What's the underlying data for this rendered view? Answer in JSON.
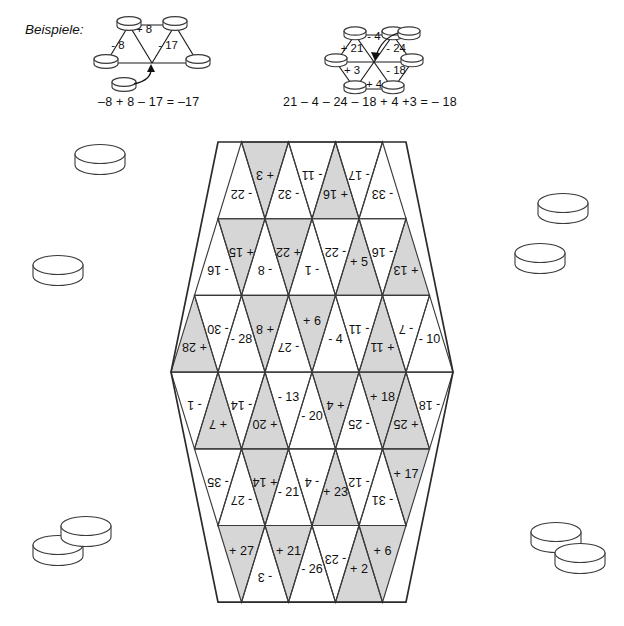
{
  "worksheet": {
    "heading": "Beispiele:",
    "examples": [
      {
        "name": "example-trapezoid",
        "edge_labels": [
          "- 8",
          "+ 8",
          "- 17"
        ],
        "equation": "–8 + 8 – 17 = –17",
        "chip_count": 4,
        "loose_chip": 1
      },
      {
        "name": "example-hexagon",
        "edge_labels": [
          "- 4",
          "+ 21",
          "- 24",
          "+ 3",
          "- 18",
          "+ 4"
        ],
        "equation": "21 – 4 – 24 – 18 + 4 +3 = – 18",
        "chip_count": 6,
        "loose_chip": 1
      }
    ]
  },
  "board": {
    "name": "hexagon-triangle-board",
    "rows": 6,
    "row_counts": [
      7,
      9,
      11,
      11,
      9,
      7
    ],
    "shaded_color": "#d6d6d6",
    "unshaded_color": "#ffffff",
    "stroke_color": "#3a3a3a",
    "cells": [
      [
        {
          "v": "- 22",
          "shaded": false,
          "dir": "up",
          "rot": 180
        },
        {
          "v": "+ 3",
          "shaded": true,
          "dir": "down",
          "rot": 180
        },
        {
          "v": "- 32",
          "shaded": false,
          "dir": "up",
          "rot": 180
        },
        {
          "v": "- 11",
          "shaded": false,
          "dir": "down",
          "rot": 180
        },
        {
          "v": "+ 16",
          "shaded": true,
          "dir": "up",
          "rot": 180
        },
        {
          "v": "- 17",
          "shaded": false,
          "dir": "down",
          "rot": 180
        },
        {
          "v": "- 33",
          "shaded": false,
          "dir": "up",
          "rot": 180
        }
      ],
      [
        {
          "v": "- 16",
          "shaded": false,
          "dir": "up",
          "rot": 180
        },
        {
          "v": "+ 15",
          "shaded": true,
          "dir": "down",
          "rot": 180
        },
        {
          "v": "- 8",
          "shaded": false,
          "dir": "up",
          "rot": 180
        },
        {
          "v": "+ 22",
          "shaded": true,
          "dir": "down",
          "rot": 180
        },
        {
          "v": "- 1",
          "shaded": false,
          "dir": "up",
          "rot": 180
        },
        {
          "v": "- 22",
          "shaded": false,
          "dir": "down",
          "rot": 180
        },
        {
          "v": "+ 5",
          "shaded": true,
          "dir": "up",
          "rot": 0
        },
        {
          "v": "- 16",
          "shaded": false,
          "dir": "down",
          "rot": 180
        },
        {
          "v": "+ 13",
          "shaded": true,
          "dir": "up",
          "rot": 180
        }
      ],
      [
        {
          "v": "+ 28",
          "shaded": true,
          "dir": "up",
          "rot": 180
        },
        {
          "v": "- 30",
          "shaded": false,
          "dir": "down",
          "rot": 180
        },
        {
          "v": "- 28",
          "shaded": false,
          "dir": "up",
          "rot": 0
        },
        {
          "v": "+ 8",
          "shaded": true,
          "dir": "down",
          "rot": 180
        },
        {
          "v": "- 27",
          "shaded": false,
          "dir": "up",
          "rot": 180
        },
        {
          "v": "+ 6",
          "shaded": true,
          "dir": "down",
          "rot": 0
        },
        {
          "v": "- 4",
          "shaded": false,
          "dir": "up",
          "rot": 0
        },
        {
          "v": "- 11",
          "shaded": false,
          "dir": "down",
          "rot": 180
        },
        {
          "v": "+ 11",
          "shaded": true,
          "dir": "up",
          "rot": 180
        },
        {
          "v": "- 7",
          "shaded": false,
          "dir": "down",
          "rot": 180
        },
        {
          "v": "- 10",
          "shaded": false,
          "dir": "up",
          "rot": 0
        }
      ],
      [
        {
          "v": "- 1",
          "shaded": false,
          "dir": "down",
          "rot": 180
        },
        {
          "v": "+ 7",
          "shaded": true,
          "dir": "up",
          "rot": 180
        },
        {
          "v": "- 14",
          "shaded": false,
          "dir": "down",
          "rot": 180
        },
        {
          "v": "+ 20",
          "shaded": true,
          "dir": "up",
          "rot": 180
        },
        {
          "v": "- 13",
          "shaded": false,
          "dir": "down",
          "rot": 0
        },
        {
          "v": "- 20",
          "shaded": false,
          "dir": "up",
          "rot": 0
        },
        {
          "v": "+ 4",
          "shaded": true,
          "dir": "down",
          "rot": 180
        },
        {
          "v": "- 25",
          "shaded": false,
          "dir": "up",
          "rot": 180
        },
        {
          "v": "+ 18",
          "shaded": true,
          "dir": "down",
          "rot": 0
        },
        {
          "v": "+ 25",
          "shaded": true,
          "dir": "up",
          "rot": 180
        },
        {
          "v": "- 18",
          "shaded": false,
          "dir": "down",
          "rot": 180
        }
      ],
      [
        {
          "v": "- 35",
          "shaded": false,
          "dir": "down",
          "rot": 180
        },
        {
          "v": "- 27",
          "shaded": false,
          "dir": "up",
          "rot": 180
        },
        {
          "v": "+ 14",
          "shaded": true,
          "dir": "down",
          "rot": 180
        },
        {
          "v": "- 21",
          "shaded": false,
          "dir": "up",
          "rot": 0
        },
        {
          "v": "- 4",
          "shaded": false,
          "dir": "down",
          "rot": 180
        },
        {
          "v": "+ 23",
          "shaded": true,
          "dir": "up",
          "rot": 0
        },
        {
          "v": "- 12",
          "shaded": false,
          "dir": "down",
          "rot": 180
        },
        {
          "v": "- 31",
          "shaded": false,
          "dir": "up",
          "rot": 180
        },
        {
          "v": "+ 17",
          "shaded": true,
          "dir": "down",
          "rot": 0
        }
      ],
      [
        {
          "v": "+ 27",
          "shaded": true,
          "dir": "down",
          "rot": 0
        },
        {
          "v": "- 3",
          "shaded": false,
          "dir": "up",
          "rot": 180
        },
        {
          "v": "+ 21",
          "shaded": true,
          "dir": "down",
          "rot": 0
        },
        {
          "v": "- 26",
          "shaded": false,
          "dir": "up",
          "rot": 0
        },
        {
          "v": "- 23",
          "shaded": false,
          "dir": "down",
          "rot": 180
        },
        {
          "v": "+ 2",
          "shaded": true,
          "dir": "up",
          "rot": 0
        },
        {
          "v": "+ 6",
          "shaded": true,
          "dir": "down",
          "rot": 0
        }
      ]
    ]
  },
  "chips": {
    "name": "game-chips",
    "positions": [
      {
        "id": "chip-top-left",
        "cx": 100,
        "cy": 154
      },
      {
        "id": "chip-mid-left",
        "cx": 58,
        "cy": 265
      },
      {
        "id": "chip-upper-right",
        "cx": 563,
        "cy": 203
      },
      {
        "id": "chip-right",
        "cx": 540,
        "cy": 253
      },
      {
        "id": "chip-bottom-left-a",
        "cx": 58,
        "cy": 545
      },
      {
        "id": "chip-bottom-left-b",
        "cx": 86,
        "cy": 526
      },
      {
        "id": "chip-bottom-right-a",
        "cx": 556,
        "cy": 532
      },
      {
        "id": "chip-bottom-right-b",
        "cx": 580,
        "cy": 553
      }
    ]
  }
}
